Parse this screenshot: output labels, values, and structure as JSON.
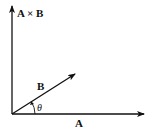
{
  "diagram": {
    "type": "vector-cross-product",
    "labels": {
      "cross": "A × B",
      "b": "B",
      "a": "A",
      "angle": "θ"
    },
    "colors": {
      "stroke": "#111111",
      "background": "#ffffff"
    }
  }
}
